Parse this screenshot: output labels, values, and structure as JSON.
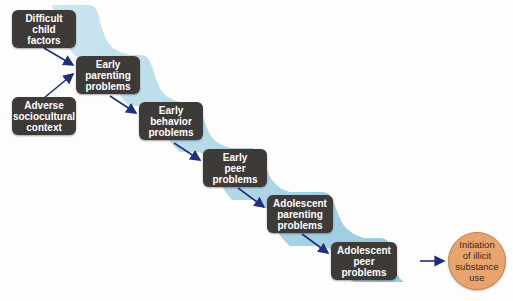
{
  "diagram": {
    "nodes": [
      {
        "id": "difficult-child-factors",
        "lines": [
          "Difficult",
          "child",
          "factors"
        ]
      },
      {
        "id": "early-parenting-problems",
        "lines": [
          "Early",
          "parenting",
          "problems"
        ]
      },
      {
        "id": "adverse-sociocultural-context",
        "lines": [
          "Adverse",
          "sociocultural",
          "context"
        ]
      },
      {
        "id": "early-behavior-problems",
        "lines": [
          "Early",
          "behavior",
          "problems"
        ]
      },
      {
        "id": "early-peer-problems",
        "lines": [
          "Early",
          "peer",
          "problems"
        ]
      },
      {
        "id": "adolescent-parenting-problems",
        "lines": [
          "Adolescent",
          "parenting",
          "problems"
        ]
      },
      {
        "id": "adolescent-peer-problems",
        "lines": [
          "Adolescent",
          "peer",
          "problems"
        ]
      },
      {
        "id": "initiation-illicit-substance-use",
        "lines": [
          "Initiation",
          "of illicit",
          "substance",
          "use"
        ]
      }
    ],
    "edges": [
      {
        "from": "difficult-child-factors",
        "to": "early-parenting-problems"
      },
      {
        "from": "adverse-sociocultural-context",
        "to": "early-parenting-problems"
      },
      {
        "from": "early-parenting-problems",
        "to": "early-behavior-problems"
      },
      {
        "from": "early-behavior-problems",
        "to": "early-peer-problems"
      },
      {
        "from": "early-peer-problems",
        "to": "adolescent-parenting-problems"
      },
      {
        "from": "adolescent-parenting-problems",
        "to": "adolescent-peer-problems"
      },
      {
        "from": "adolescent-peer-problems",
        "to": "initiation-illicit-substance-use"
      }
    ],
    "colors": {
      "box_fill": "#3d3a38",
      "box_text": "#ffffff",
      "circle_fill": "#e8a46e",
      "circle_border": "#c8804a",
      "arrow": "#1f2f7a",
      "ribbon": "#a9d3e3"
    }
  }
}
